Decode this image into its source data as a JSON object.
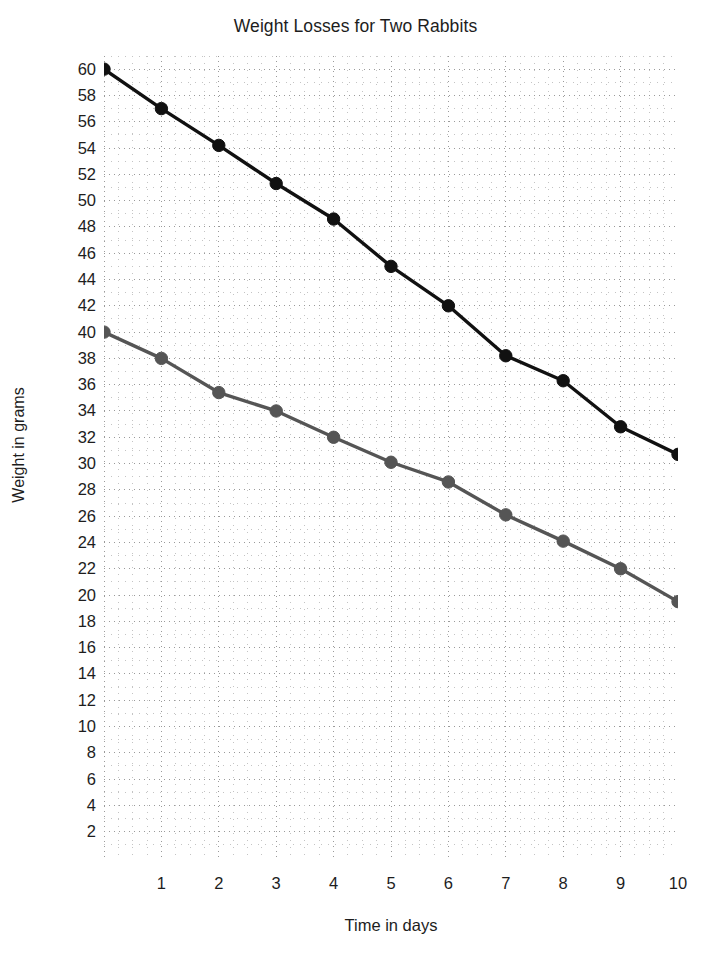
{
  "chart_data": {
    "type": "line",
    "title": "Weight Losses for Two Rabbits",
    "xlabel": "Time in days",
    "ylabel": "Weight in grams",
    "x": [
      0,
      1,
      2,
      3,
      4,
      5,
      6,
      7,
      8,
      9,
      10
    ],
    "xlim": [
      0,
      10
    ],
    "ylim": [
      0,
      61
    ],
    "xticks": [
      "1",
      "2",
      "3",
      "4",
      "5",
      "6",
      "7",
      "8",
      "9",
      "10"
    ],
    "xtick_values": [
      1,
      2,
      3,
      4,
      5,
      6,
      7,
      8,
      9,
      10
    ],
    "yticks": [
      "60",
      "58",
      "56",
      "54",
      "52",
      "50",
      "48",
      "46",
      "44",
      "42",
      "40",
      "38",
      "36",
      "34",
      "32",
      "30",
      "28",
      "26",
      "24",
      "22",
      "20",
      "18",
      "16",
      "14",
      "12",
      "10",
      "8",
      "6",
      "4",
      "2"
    ],
    "ytick_values": [
      60,
      58,
      56,
      54,
      52,
      50,
      48,
      46,
      44,
      42,
      40,
      38,
      36,
      34,
      32,
      30,
      28,
      26,
      24,
      22,
      20,
      18,
      16,
      14,
      12,
      10,
      8,
      6,
      4,
      2
    ],
    "grid": true,
    "grid_style": "dotted",
    "grid_minor": true,
    "legend": "none",
    "series": [
      {
        "name": "Rabbit 1",
        "color": "#111111",
        "marker": "circle",
        "values": [
          60,
          57,
          54.2,
          51.3,
          48.6,
          45.0,
          42.0,
          38.2,
          36.3,
          32.8,
          30.7
        ]
      },
      {
        "name": "Rabbit 2",
        "color": "#555555",
        "marker": "circle",
        "values": [
          40,
          38,
          35.4,
          34.0,
          32.0,
          30.1,
          28.6,
          26.1,
          24.1,
          22.0,
          19.5
        ]
      }
    ]
  }
}
